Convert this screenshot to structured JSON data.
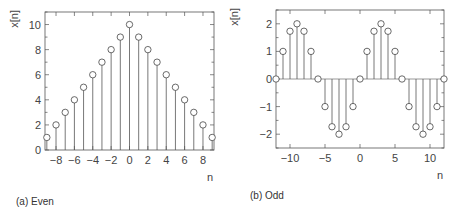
{
  "chart_data": [
    {
      "type": "stem",
      "panel": "a",
      "caption": "(a) Even",
      "xlabel": "n",
      "ylabel": "x[n]",
      "xlim": [
        -9.2,
        9.2
      ],
      "ylim": [
        0,
        11
      ],
      "xticks": [
        -8,
        -6,
        -4,
        -2,
        0,
        2,
        4,
        6,
        8
      ],
      "yticks": [
        0,
        2,
        4,
        6,
        8,
        10
      ],
      "grid": false,
      "x": [
        -9,
        -8,
        -7,
        -6,
        -5,
        -4,
        -3,
        -2,
        -1,
        0,
        1,
        2,
        3,
        4,
        5,
        6,
        7,
        8,
        9
      ],
      "values": [
        1,
        2,
        3,
        4,
        5,
        6,
        7,
        8,
        9,
        10,
        9,
        8,
        7,
        6,
        5,
        4,
        3,
        2,
        1
      ]
    },
    {
      "type": "stem",
      "panel": "b",
      "caption": "(b) Odd",
      "xlabel": "n",
      "ylabel": "x[n]",
      "xlim": [
        -12,
        12
      ],
      "ylim": [
        -2.5,
        2.5
      ],
      "xticks": [
        -10,
        -5,
        0,
        5,
        10
      ],
      "yticks": [
        -2,
        -1,
        0,
        1,
        2
      ],
      "grid": false,
      "x": [
        -12,
        -11,
        -10,
        -9,
        -8,
        -7,
        -6,
        -5,
        -4,
        -3,
        -2,
        -1,
        0,
        1,
        2,
        3,
        4,
        5,
        6,
        7,
        8,
        9,
        10,
        11,
        12
      ],
      "values": [
        0,
        1,
        1.73,
        2,
        1.73,
        1,
        0,
        -1,
        -1.73,
        -2,
        -1.73,
        -1,
        0,
        1,
        1.73,
        2,
        1.73,
        1,
        0,
        -1,
        -1.73,
        -2,
        -1.73,
        -1,
        0
      ]
    }
  ],
  "style": {
    "line_color": "#555555",
    "marker_color": "#444444",
    "axis_color": "#555555"
  }
}
